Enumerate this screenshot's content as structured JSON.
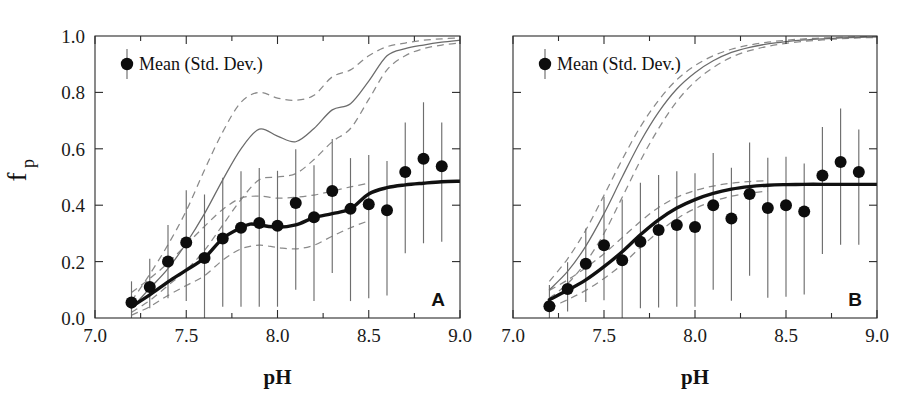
{
  "figure": {
    "width": 914,
    "height": 414,
    "background": "#ffffff",
    "ink_color": "#111111",
    "model_color": "#6b6b6b",
    "band_color": "#8a8a8a",
    "point_color": "#0d0d0d"
  },
  "axes": {
    "x_title": "pH",
    "y_title_main": "f",
    "y_title_sub": "p",
    "x_ticklabels": [
      "7.0",
      "7.5",
      "8.0",
      "8.5",
      "9.0"
    ],
    "x_tickvalues": [
      7.0,
      7.5,
      8.0,
      8.5,
      9.0
    ],
    "y_ticklabels": [
      "0.0",
      "0.2",
      "0.4",
      "0.6",
      "0.8",
      "1.0"
    ],
    "y_tickvalues": [
      0.0,
      0.2,
      0.4,
      0.6,
      0.8,
      1.0
    ],
    "xlim": [
      7.0,
      9.0
    ],
    "ylim": [
      0.0,
      1.0
    ],
    "x_minor_step": 0.25,
    "grid": false
  },
  "legend": {
    "label": "Mean (Std. Dev.)",
    "marker": "filled-circle-with-errorbar",
    "position": "upper-left"
  },
  "panels": [
    {
      "letter": "A",
      "letter_position": "lower-right"
    },
    {
      "letter": "B",
      "letter_position": "lower-right"
    }
  ],
  "chart_data": [
    {
      "type": "scatter",
      "panel": "A",
      "title": "",
      "xlabel": "pH",
      "ylabel": "f_p",
      "xlim": [
        7.0,
        9.0
      ],
      "ylim": [
        0.0,
        1.0
      ],
      "grid": false,
      "legend": "Mean (Std. Dev.)",
      "series": [
        {
          "name": "Mean (Std. Dev.)",
          "style": "points-with-errorbars",
          "x": [
            7.2,
            7.3,
            7.4,
            7.5,
            7.6,
            7.7,
            7.8,
            7.9,
            8.0,
            8.1,
            8.2,
            8.3,
            8.4,
            8.5,
            8.6,
            8.7,
            8.8,
            8.9
          ],
          "y": [
            0.055,
            0.11,
            0.2,
            0.268,
            0.213,
            0.282,
            0.32,
            0.337,
            0.327,
            0.408,
            0.357,
            0.45,
            0.387,
            0.403,
            0.382,
            0.518,
            0.565,
            0.538
          ],
          "err_low": [
            0.055,
            0.075,
            0.13,
            0.208,
            0.213,
            0.242,
            0.28,
            0.297,
            0.287,
            0.308,
            0.297,
            0.29,
            0.327,
            0.333,
            0.302,
            0.288,
            0.3,
            0.268
          ],
          "err_high": [
            0.075,
            0.1,
            0.13,
            0.185,
            0.225,
            0.215,
            0.2,
            0.195,
            0.195,
            0.19,
            0.185,
            0.185,
            0.18,
            0.175,
            0.175,
            0.175,
            0.2,
            0.155
          ]
        },
        {
          "name": "observed-fit",
          "style": "thick-solid-line",
          "x": [
            7.2,
            7.3,
            7.4,
            7.5,
            7.6,
            7.7,
            7.8,
            7.85,
            7.9,
            8.0,
            8.1,
            8.2,
            8.3,
            8.4,
            8.5,
            8.6,
            8.7,
            8.8,
            8.9,
            9.0
          ],
          "y": [
            0.04,
            0.082,
            0.128,
            0.17,
            0.213,
            0.282,
            0.32,
            0.333,
            0.33,
            0.322,
            0.33,
            0.356,
            0.37,
            0.387,
            0.44,
            0.462,
            0.472,
            0.478,
            0.483,
            0.485
          ]
        },
        {
          "name": "model-mean",
          "style": "thin-solid-line",
          "x": [
            7.2,
            7.3,
            7.4,
            7.5,
            7.6,
            7.7,
            7.8,
            7.9,
            8.0,
            8.1,
            8.2,
            8.3,
            8.4,
            8.5,
            8.6,
            8.7,
            8.8,
            8.9,
            9.0
          ],
          "y": [
            0.035,
            0.105,
            0.175,
            0.265,
            0.37,
            0.49,
            0.6,
            0.67,
            0.645,
            0.625,
            0.672,
            0.738,
            0.76,
            0.84,
            0.93,
            0.955,
            0.968,
            0.978,
            0.985
          ]
        },
        {
          "name": "model-upper",
          "style": "dashed-line",
          "x": [
            7.2,
            7.3,
            7.4,
            7.5,
            7.6,
            7.7,
            7.8,
            7.9,
            8.0,
            8.1,
            8.2,
            8.3,
            8.4,
            8.5,
            8.6,
            8.7,
            8.8,
            8.9,
            9.0
          ],
          "y": [
            0.06,
            0.155,
            0.26,
            0.38,
            0.525,
            0.66,
            0.765,
            0.8,
            0.78,
            0.772,
            0.79,
            0.855,
            0.88,
            0.93,
            0.962,
            0.975,
            0.985,
            0.99,
            0.993
          ]
        },
        {
          "name": "model-lower",
          "style": "dashed-line",
          "x": [
            7.2,
            7.3,
            7.4,
            7.5,
            7.6,
            7.7,
            7.8,
            7.9,
            8.0,
            8.1,
            8.2,
            8.3,
            8.4,
            8.5,
            8.6,
            8.7,
            8.8,
            8.9,
            9.0
          ],
          "y": [
            0.02,
            0.062,
            0.115,
            0.17,
            0.24,
            0.33,
            0.42,
            0.49,
            0.5,
            0.512,
            0.562,
            0.625,
            0.672,
            0.775,
            0.88,
            0.93,
            0.955,
            0.968,
            0.975
          ]
        },
        {
          "name": "obs-band-upper",
          "style": "dashed-line",
          "x": [
            7.2,
            7.3,
            7.4,
            7.5,
            7.6,
            7.7,
            7.8,
            7.9,
            8.0,
            8.1,
            8.2,
            8.3,
            8.4,
            8.5
          ],
          "y": [
            0.09,
            0.14,
            0.195,
            0.26,
            0.325,
            0.385,
            0.425,
            0.432,
            0.425,
            0.428,
            0.436,
            0.45,
            0.465,
            0.478
          ]
        },
        {
          "name": "obs-band-lower",
          "style": "dashed-line",
          "x": [
            7.2,
            7.3,
            7.4,
            7.5,
            7.6,
            7.7,
            7.8,
            7.9,
            8.0,
            8.1,
            8.2,
            8.3,
            8.4,
            8.5
          ],
          "y": [
            0.01,
            0.04,
            0.08,
            0.115,
            0.15,
            0.205,
            0.245,
            0.258,
            0.25,
            0.245,
            0.258,
            0.29,
            0.32,
            0.345
          ]
        }
      ]
    },
    {
      "type": "scatter",
      "panel": "B",
      "title": "",
      "xlabel": "pH",
      "ylabel": "f_p",
      "xlim": [
        7.0,
        9.0
      ],
      "ylim": [
        0.0,
        1.0
      ],
      "grid": false,
      "legend": "Mean (Std. Dev.)",
      "series": [
        {
          "name": "Mean (Std. Dev.)",
          "style": "points-with-errorbars",
          "x": [
            7.2,
            7.3,
            7.4,
            7.5,
            7.6,
            7.7,
            7.8,
            7.9,
            8.0,
            8.1,
            8.2,
            8.3,
            8.4,
            8.5,
            8.6,
            8.7,
            8.8,
            8.9
          ],
          "y": [
            0.042,
            0.103,
            0.192,
            0.258,
            0.205,
            0.27,
            0.312,
            0.33,
            0.323,
            0.4,
            0.353,
            0.44,
            0.39,
            0.4,
            0.378,
            0.505,
            0.553,
            0.518
          ],
          "err_low": [
            0.042,
            0.08,
            0.135,
            0.195,
            0.205,
            0.235,
            0.275,
            0.29,
            0.283,
            0.3,
            0.292,
            0.29,
            0.318,
            0.325,
            0.295,
            0.278,
            0.293,
            0.258
          ],
          "err_high": [
            0.075,
            0.095,
            0.125,
            0.172,
            0.215,
            0.21,
            0.195,
            0.19,
            0.19,
            0.185,
            0.18,
            0.182,
            0.178,
            0.172,
            0.17,
            0.172,
            0.19,
            0.15
          ]
        },
        {
          "name": "observed-fit",
          "style": "thick-solid-line",
          "x": [
            7.2,
            7.3,
            7.4,
            7.5,
            7.6,
            7.7,
            7.8,
            7.9,
            8.0,
            8.1,
            8.2,
            8.3,
            8.4,
            8.5,
            8.6,
            8.7,
            8.8,
            8.9,
            9.0
          ],
          "y": [
            0.065,
            0.098,
            0.135,
            0.182,
            0.235,
            0.295,
            0.348,
            0.39,
            0.42,
            0.442,
            0.457,
            0.466,
            0.471,
            0.473,
            0.474,
            0.474,
            0.474,
            0.474,
            0.474
          ]
        },
        {
          "name": "model-mean",
          "style": "thin-solid-line",
          "x": [
            7.2,
            7.3,
            7.4,
            7.5,
            7.6,
            7.7,
            7.8,
            7.9,
            8.0,
            8.1,
            8.2,
            8.3,
            8.4,
            8.5,
            8.6,
            8.7,
            8.8,
            8.9,
            9.0
          ],
          "y": [
            0.1,
            0.165,
            0.255,
            0.37,
            0.5,
            0.625,
            0.73,
            0.812,
            0.87,
            0.912,
            0.942,
            0.96,
            0.972,
            0.98,
            0.986,
            0.99,
            0.993,
            0.995,
            0.997
          ]
        },
        {
          "name": "model-upper",
          "style": "dashed-line",
          "x": [
            7.2,
            7.3,
            7.4,
            7.5,
            7.6,
            7.7,
            7.8,
            7.9,
            8.0,
            8.1,
            8.2,
            8.3,
            8.4,
            8.5,
            8.6,
            8.7,
            8.8,
            8.9,
            9.0
          ],
          "y": [
            0.13,
            0.21,
            0.312,
            0.435,
            0.562,
            0.678,
            0.772,
            0.845,
            0.895,
            0.93,
            0.953,
            0.968,
            0.978,
            0.985,
            0.99,
            0.993,
            0.995,
            0.997,
            0.998
          ]
        },
        {
          "name": "model-lower",
          "style": "dashed-line",
          "x": [
            7.2,
            7.3,
            7.4,
            7.5,
            7.6,
            7.7,
            7.8,
            7.9,
            8.0,
            8.1,
            8.2,
            8.3,
            8.4,
            8.5,
            8.6,
            8.7,
            8.8,
            8.9,
            9.0
          ],
          "y": [
            0.07,
            0.122,
            0.198,
            0.3,
            0.428,
            0.558,
            0.672,
            0.768,
            0.838,
            0.888,
            0.925,
            0.948,
            0.963,
            0.974,
            0.981,
            0.986,
            0.99,
            0.993,
            0.995
          ]
        },
        {
          "name": "obs-band-upper",
          "style": "dashed-line",
          "x": [
            7.2,
            7.3,
            7.4,
            7.5,
            7.6,
            7.7,
            7.8,
            7.9,
            8.0,
            8.1,
            8.2,
            8.3,
            8.4
          ],
          "y": [
            0.098,
            0.135,
            0.178,
            0.228,
            0.285,
            0.342,
            0.392,
            0.428,
            0.452,
            0.468,
            0.478,
            0.484,
            0.487
          ]
        },
        {
          "name": "obs-band-lower",
          "style": "dashed-line",
          "x": [
            7.2,
            7.3,
            7.4,
            7.5,
            7.6,
            7.7,
            7.8,
            7.9,
            8.0,
            8.1,
            8.2,
            8.3,
            8.4
          ],
          "y": [
            0.035,
            0.065,
            0.098,
            0.14,
            0.19,
            0.25,
            0.305,
            0.352,
            0.388,
            0.414,
            0.432,
            0.443,
            0.45
          ]
        }
      ]
    }
  ]
}
